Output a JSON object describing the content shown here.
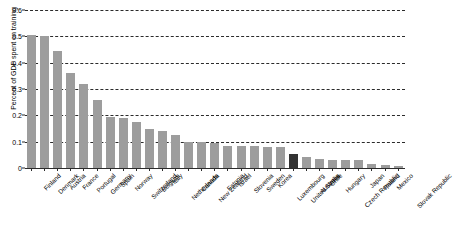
{
  "chart_data": {
    "type": "bar",
    "title": "",
    "xlabel": "",
    "ylabel": "Percent of GDP spent on training",
    "ylim": [
      0,
      0.6
    ],
    "yticks": [
      "0",
      "0.1",
      "0.2",
      "0.3",
      "0.4",
      "0.5",
      "0.6"
    ],
    "ytick_values": [
      0,
      0.1,
      0.2,
      0.3,
      0.4,
      0.5,
      0.6
    ],
    "grid": true,
    "legend": "none",
    "bar_color": "#9d9d9d",
    "highlight_color": "#333333",
    "highlight_category": "United States",
    "categories": [
      "Finland",
      "Denmark",
      "Austria",
      "France",
      "Portugal",
      "Germany",
      "Spain",
      "Norway",
      "Switzerland",
      "Belgium",
      "Italy",
      "Netherlands",
      "Canada",
      "New Zealand",
      "Estonia",
      "Israel",
      "Slovenia",
      "Sweden",
      "Korea",
      "Luxembourg",
      "United States",
      "Australia",
      "Chile",
      "Hungary",
      "Czech Republic",
      "Japan",
      "Poland",
      "Mexico",
      "Slovak Republic"
    ],
    "values": [
      0.505,
      0.5,
      0.445,
      0.36,
      0.32,
      0.26,
      0.195,
      0.19,
      0.175,
      0.15,
      0.14,
      0.125,
      0.1,
      0.1,
      0.095,
      0.085,
      0.085,
      0.085,
      0.08,
      0.08,
      0.055,
      0.04,
      0.035,
      0.03,
      0.03,
      0.03,
      0.015,
      0.012,
      0.006
    ]
  }
}
